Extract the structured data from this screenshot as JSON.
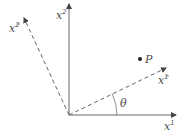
{
  "diagram": {
    "type": "coordinate-rotation",
    "origin": [
      69,
      115
    ],
    "colors": {
      "axis": "#555555",
      "dashed_axis": "#555555",
      "text": "#4a4a4a",
      "point": "#222222"
    },
    "axes": {
      "x1": {
        "base": "x",
        "sup": "1",
        "bar": false,
        "end": [
          176,
          115
        ],
        "label_pos": [
          164,
          130
        ],
        "style": "solid"
      },
      "x2": {
        "base": "x",
        "sup": "2",
        "bar": false,
        "end": [
          69,
          4
        ],
        "label_pos": [
          56,
          19
        ],
        "style": "solid"
      },
      "x1bar": {
        "base": "x",
        "sup": "1",
        "bar": true,
        "end": [
          166,
          68
        ],
        "label_pos": [
          158,
          84
        ],
        "style": "dashed"
      },
      "x2bar": {
        "base": "x",
        "sup": "2",
        "bar": true,
        "end": [
          24,
          18
        ],
        "label_pos": [
          9,
          32
        ],
        "style": "dashed"
      }
    },
    "point": {
      "label": "P",
      "position": [
        140,
        59
      ],
      "label_pos": [
        145,
        63
      ]
    },
    "angle": {
      "label": "θ",
      "label_pos": [
        120,
        107
      ],
      "arc_radius": 48
    }
  }
}
